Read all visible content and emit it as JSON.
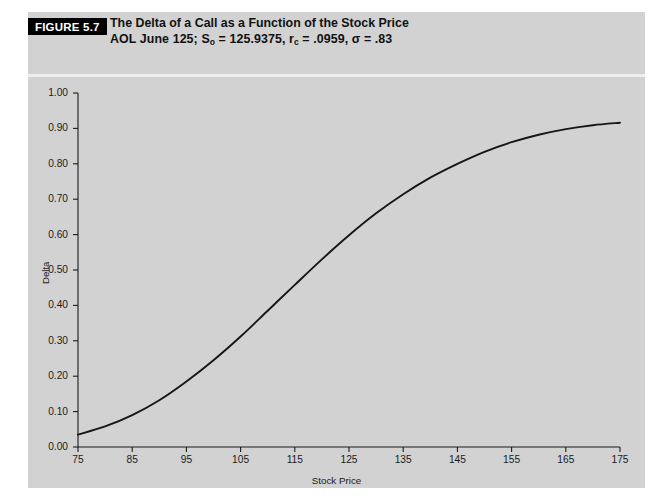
{
  "figure": {
    "badge": "FIGURE 5.7",
    "title_line1": "The Delta of a Call as a Function of the Stock Price",
    "subtitle_prefix": "AOL June 125; S",
    "subtitle_sub1": "o",
    "subtitle_mid": " = 125.9375, r",
    "subtitle_sub2": "c",
    "subtitle_tail": " = .0959, σ = .83",
    "panel_color": "#d2d2d2",
    "badge_color": "#000000",
    "curve_color": "#15151a"
  },
  "chart_data": {
    "type": "line",
    "title": "The Delta of a Call as a Function of the Stock Price",
    "subtitle": "AOL June 125; So = 125.9375, rc = .0959, σ = .83",
    "xlabel": "Stock Price",
    "ylabel": "Delta",
    "xlim": [
      75,
      175
    ],
    "ylim": [
      0.0,
      1.0
    ],
    "grid": false,
    "legend": null,
    "xticks": [
      75,
      85,
      95,
      105,
      115,
      125,
      135,
      145,
      155,
      165,
      175
    ],
    "xtick_labels": [
      "75",
      "85",
      "95",
      "105",
      "115",
      "125",
      "135",
      "145",
      "155",
      "165",
      "175"
    ],
    "yticks": [
      0.0,
      0.1,
      0.2,
      0.3,
      0.4,
      0.5,
      0.6,
      0.7,
      0.8,
      0.9,
      1.0
    ],
    "ytick_labels": [
      "0.00",
      "0.10",
      "0.20",
      "0.30",
      "0.40",
      "0.50",
      "0.60",
      "0.70",
      "0.80",
      "0.90",
      "1.00"
    ],
    "series": [
      {
        "name": "Delta",
        "x": [
          75,
          80,
          85,
          90,
          95,
          100,
          105,
          110,
          115,
          120,
          125,
          130,
          135,
          140,
          145,
          150,
          155,
          160,
          165,
          170,
          175
        ],
        "values": [
          0.035,
          0.058,
          0.09,
          0.132,
          0.185,
          0.245,
          0.312,
          0.385,
          0.458,
          0.53,
          0.598,
          0.66,
          0.714,
          0.761,
          0.8,
          0.834,
          0.861,
          0.882,
          0.898,
          0.909,
          0.916
        ]
      }
    ]
  }
}
